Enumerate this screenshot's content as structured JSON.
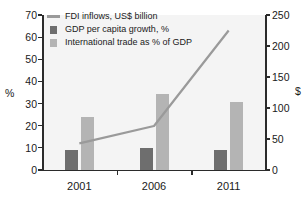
{
  "chart_data": {
    "type": "bar",
    "title": "",
    "subtitle": "",
    "categories": [
      "2001",
      "2006",
      "2011"
    ],
    "xlabel": "",
    "ylabel": "%",
    "ylabel_right": "$",
    "ylim": [
      0,
      70
    ],
    "ylim_right": [
      0,
      250
    ],
    "yticks": [
      0,
      10,
      20,
      30,
      40,
      50,
      60,
      70
    ],
    "yticks_right": [
      0,
      50,
      100,
      150,
      200,
      250
    ],
    "grid": false,
    "legend_position": "top-left",
    "series": [
      {
        "name": "FDI inflows, US$ billion",
        "type": "line",
        "axis": "right",
        "color": "#9a9a9a",
        "values": [
          43,
          71,
          225
        ]
      },
      {
        "name": "GDP per capita growth, %",
        "type": "bar",
        "axis": "left",
        "color": "#6e6e6e",
        "values": [
          9,
          10,
          9
        ]
      },
      {
        "name": "International trade as % of GDP",
        "type": "bar",
        "axis": "left",
        "color": "#b4b4b4",
        "values": [
          24,
          34.5,
          30.5
        ]
      }
    ]
  },
  "legend": {
    "items": [
      {
        "label": "FDI inflows, US$ billion",
        "key": "line-key-icon"
      },
      {
        "label": "GDP per capita growth, %",
        "key": "dark-swatch-icon"
      },
      {
        "label": "International trade as % of GDP",
        "key": "light-swatch-icon"
      }
    ]
  },
  "axes": {
    "left_title": "%",
    "right_title": "$",
    "left_ticks": [
      "70",
      "60",
      "50",
      "40",
      "30",
      "20",
      "10",
      "0"
    ],
    "right_ticks": [
      "250",
      "200",
      "150",
      "100",
      "50",
      "0"
    ],
    "x_ticks": [
      "2001",
      "2006",
      "2011"
    ]
  }
}
